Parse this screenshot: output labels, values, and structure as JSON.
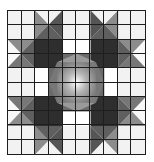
{
  "figure": {
    "grid": {
      "rows": 10,
      "cols": 10
    },
    "colors": {
      "background": "#f2f2f2",
      "light": "#d9d9d9",
      "mid": "#8c8c8c",
      "dark": "#555555",
      "darkest": "#2e2e2e",
      "grid_line": "#1e1e1e",
      "center_highlight": "#ffffff"
    },
    "motifs": [
      {
        "name": "star-top-left",
        "center": [
          3,
          3
        ]
      },
      {
        "name": "star-top-right",
        "center": [
          7,
          3
        ]
      },
      {
        "name": "star-bottom-left",
        "center": [
          3,
          7
        ]
      },
      {
        "name": "star-bottom-right",
        "center": [
          7,
          7
        ]
      },
      {
        "name": "center-medallion",
        "center": [
          5,
          5
        ]
      }
    ]
  }
}
